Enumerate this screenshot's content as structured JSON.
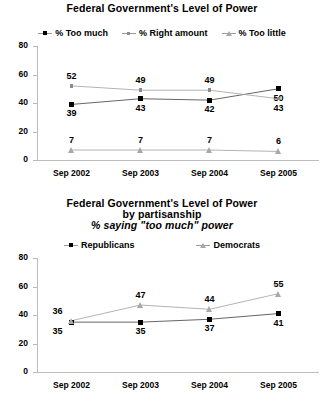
{
  "chart_data": [
    {
      "type": "line",
      "title": "Federal Government's Level of Power",
      "xlabel": "",
      "ylabel": "",
      "ylim": [
        0,
        80
      ],
      "yticks": [
        0,
        20,
        40,
        60,
        80
      ],
      "grid": false,
      "legend_position": "top",
      "categories": [
        "Sep 2002",
        "Sep 2003",
        "Sep 2004",
        "Sep 2005"
      ],
      "series": [
        {
          "name": "% Too much",
          "marker": "square-black",
          "color": "#000000",
          "values": [
            39,
            43,
            42,
            50
          ]
        },
        {
          "name": "% Right amount",
          "marker": "dot-gray",
          "color": "#8d8d8d",
          "values": [
            52,
            49,
            49,
            43
          ]
        },
        {
          "name": "% Too little",
          "marker": "triangle-gray",
          "color": "#a8a8a8",
          "values": [
            7,
            7,
            7,
            6
          ]
        }
      ]
    },
    {
      "type": "line",
      "title": "Federal Government's Level of Power",
      "title_line2": "by partisanship",
      "title_line3": "% saying \"too much\" power",
      "xlabel": "",
      "ylabel": "",
      "ylim": [
        0,
        80
      ],
      "yticks": [
        0,
        20,
        40,
        60,
        80
      ],
      "grid": false,
      "legend_position": "top",
      "categories": [
        "Sep 2002",
        "Sep 2003",
        "Sep 2004",
        "Sep 2005"
      ],
      "series": [
        {
          "name": "Republicans",
          "marker": "square-black",
          "color": "#000000",
          "values": [
            35,
            35,
            37,
            41
          ]
        },
        {
          "name": "Democrats",
          "marker": "triangle-gray",
          "color": "#a8a8a8",
          "values": [
            36,
            47,
            44,
            55
          ]
        }
      ]
    }
  ]
}
